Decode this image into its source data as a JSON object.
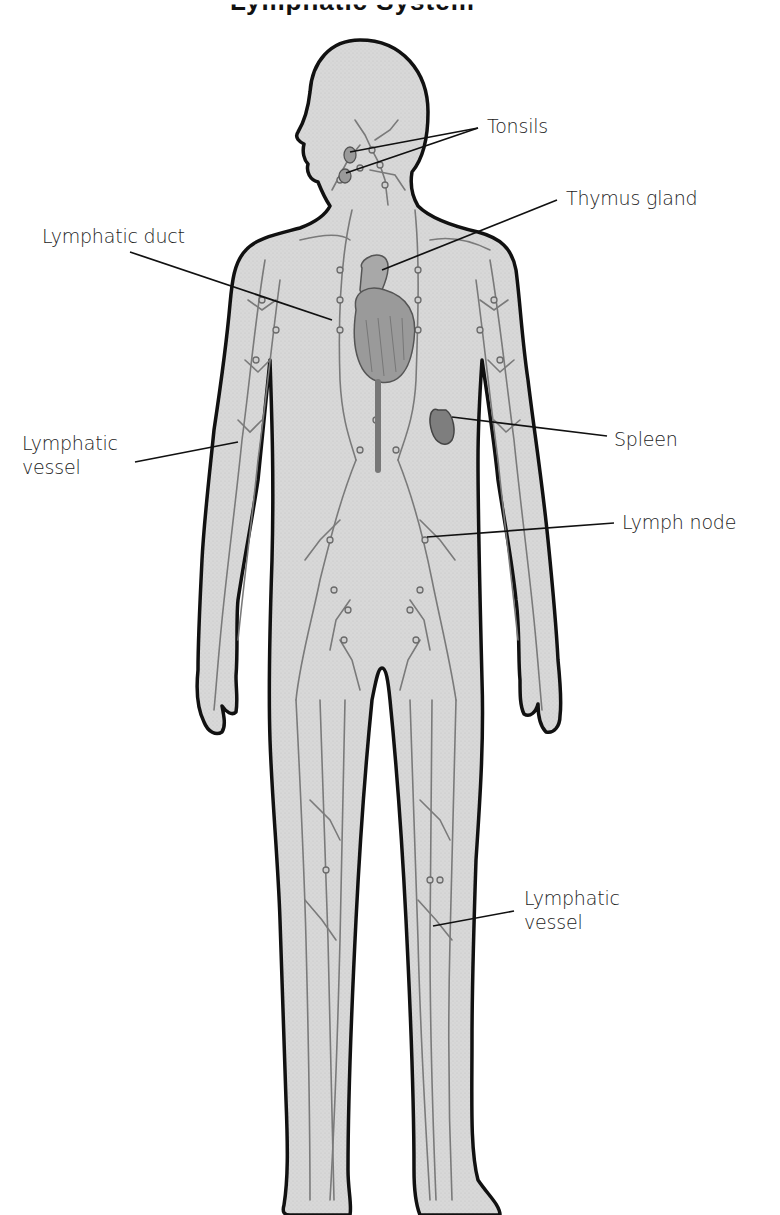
{
  "diagram": {
    "title": "Lymphatic System",
    "colors": {
      "body_fill": "#d6d6d6",
      "outline": "#111111",
      "vessel": "#7a7a7a",
      "organ": "#8a8a8a",
      "label_text": "#1c1c1c",
      "background": "#ffffff"
    },
    "labels": [
      {
        "id": "tonsils",
        "text": "Tonsils",
        "side": "right"
      },
      {
        "id": "thymus",
        "text": "Thymus gland",
        "side": "right"
      },
      {
        "id": "lymphatic-duct",
        "text": "Lymphatic duct",
        "side": "left"
      },
      {
        "id": "lymphatic-vessel-arm",
        "text": "Lymphatic\nvessel",
        "side": "left"
      },
      {
        "id": "spleen",
        "text": "Spleen",
        "side": "right"
      },
      {
        "id": "lymph-node",
        "text": "Lymph node",
        "side": "right"
      },
      {
        "id": "lymphatic-vessel-leg",
        "text": "Lymphatic\nvessel",
        "side": "right"
      }
    ]
  }
}
